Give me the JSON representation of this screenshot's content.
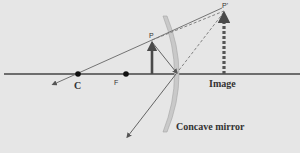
{
  "diagram": {
    "type": "ray-diagram",
    "labels": {
      "center_of_curvature": "C",
      "focal_point": "F",
      "object_tip": "P",
      "image_tip": "P'",
      "image": "Image",
      "mirror": "Concave mirror"
    },
    "colors": {
      "background": "#e6e6e6",
      "axis": "#444444",
      "rays": "#555555",
      "object_arrow": "#4a4a4a",
      "image_arrow": "#555555",
      "mirror_fill": "#c9c9c9",
      "mirror_stroke": "#9a9a9a"
    }
  }
}
